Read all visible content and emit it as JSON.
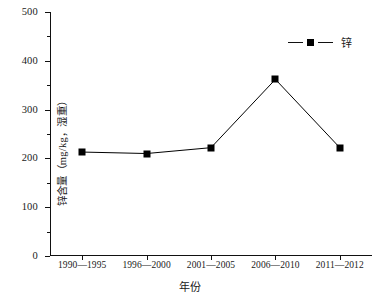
{
  "chart_data": {
    "type": "line",
    "title": "",
    "xlabel": "年份",
    "ylabel": "锌含量（mg/kg，湿重）",
    "categories": [
      "1990—1995",
      "1996—2000",
      "2001—2005",
      "2006—2010",
      "2011—2012"
    ],
    "series": [
      {
        "name": "锌",
        "values": [
          213,
          210,
          222,
          362,
          222
        ],
        "marker": "filled-square",
        "color": "#000000"
      }
    ],
    "ylim": [
      0,
      500
    ],
    "ytick_labels": [
      "0",
      "100",
      "200",
      "300",
      "400",
      "500"
    ],
    "ytick_values": [
      0,
      100,
      200,
      300,
      400,
      500
    ],
    "yminor_values": [
      50,
      150,
      250,
      350,
      450
    ],
    "grid": false,
    "legend": {
      "position": "top-right",
      "entries": [
        "锌"
      ]
    }
  },
  "legend": {
    "label": "锌"
  },
  "axes": {
    "x_title": "年份",
    "y_title": "锌含量（mg/kg，湿重）"
  }
}
